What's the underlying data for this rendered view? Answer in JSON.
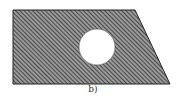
{
  "figure": {
    "caption": "b)",
    "shape": "trapezoid",
    "fill_pattern": "diagonal-hatch",
    "hole": "circle",
    "colors": {
      "hatch_dark": "#3a3a3a",
      "hatch_light": "#b0b0b0",
      "outline": "#222222",
      "hole": "#ffffff"
    }
  }
}
